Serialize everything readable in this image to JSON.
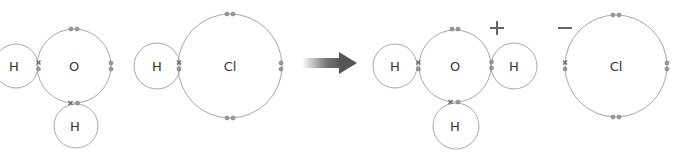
{
  "diagram": {
    "type": "dot-and-cross reaction",
    "reactants": [
      {
        "name": "water",
        "atoms": [
          {
            "symbol": "H",
            "role": "left-hydrogen"
          },
          {
            "symbol": "O",
            "role": "oxygen"
          },
          {
            "symbol": "H",
            "role": "bottom-hydrogen"
          }
        ]
      },
      {
        "name": "hydrogen-chloride",
        "atoms": [
          {
            "symbol": "H",
            "role": "hydrogen"
          },
          {
            "symbol": "Cl",
            "role": "chlorine"
          }
        ]
      }
    ],
    "arrow": "reaction-arrow",
    "products": [
      {
        "name": "hydronium",
        "charge": "+",
        "atoms": [
          {
            "symbol": "H",
            "role": "left-hydrogen"
          },
          {
            "symbol": "O",
            "role": "oxygen"
          },
          {
            "symbol": "H",
            "role": "right-hydrogen"
          },
          {
            "symbol": "H",
            "role": "bottom-hydrogen"
          }
        ]
      },
      {
        "name": "chloride",
        "charge": "−",
        "atoms": [
          {
            "symbol": "Cl",
            "role": "chlorine"
          }
        ]
      }
    ],
    "colors": {
      "stroke": "#a8a8a8",
      "text": "#333333",
      "arrow": "#555555",
      "electron": "#9a9a9a"
    }
  },
  "labels": {
    "h": "H",
    "o": "O",
    "cl": "Cl",
    "plus": "+",
    "minus": "−"
  }
}
